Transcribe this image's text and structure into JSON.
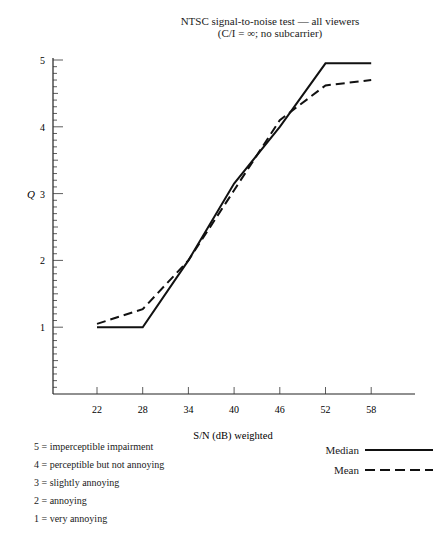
{
  "chart_data": {
    "type": "line",
    "title": "NTSC signal-to-noise test — all viewers",
    "subtitle": "(C/I = ∞; no subcarrier)",
    "xlabel": "S/N (dB) weighted",
    "ylabel": "Q",
    "x": [
      22,
      28,
      34,
      40,
      46,
      52,
      58
    ],
    "x_ticks": [
      "22",
      "28",
      "34",
      "40",
      "46",
      "52",
      "58"
    ],
    "y_ticks": [
      "1",
      "2",
      "3",
      "4",
      "5"
    ],
    "ylim": [
      0,
      5
    ],
    "grid": false,
    "series": [
      {
        "name": "Median",
        "style": "solid",
        "values": [
          1.0,
          1.0,
          2.0,
          3.15,
          4.0,
          4.95,
          4.95
        ]
      },
      {
        "name": "Mean",
        "style": "dashed",
        "values": [
          1.05,
          1.27,
          2.0,
          3.05,
          4.1,
          4.62,
          4.7
        ]
      }
    ],
    "scale_legend": [
      "5 = imperceptible impairment",
      "4 = perceptible but not annoying",
      "3 = slightly annoying",
      "2 = annoying",
      "1 = very annoying"
    ],
    "legend_position": "bottom-right"
  }
}
